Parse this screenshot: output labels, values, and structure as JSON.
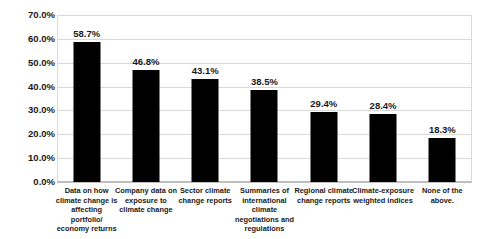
{
  "chart_data": {
    "type": "bar",
    "title": "",
    "subtitle": "",
    "xlabel": "",
    "ylabel": "",
    "ylim": [
      0,
      70
    ],
    "grid": true,
    "legend": false,
    "legend_position": "none",
    "bar_color": "#000000",
    "gridline_color": "#D9D9D9",
    "value_label_suffix": "%",
    "categories": [
      "Data on how climate change is affecting portfolio/ economy returns",
      "Company data on exposure to climate change",
      "Sector climate change reports",
      "Summaries of international climate negotiations and regulations",
      "Regional climate change reports",
      "Climate-exposure weighted indices",
      "None of the above."
    ],
    "values": [
      58.7,
      46.8,
      43.1,
      38.5,
      29.4,
      28.4,
      18.3
    ],
    "value_labels": [
      "58.7%",
      "46.8%",
      "43.1%",
      "38.5%",
      "29.4%",
      "28.4%",
      "18.3%"
    ],
    "yticks": [
      70,
      60,
      50,
      40,
      30,
      20,
      10,
      0
    ],
    "ytick_labels": [
      "70.0%",
      "60.0%",
      "50.0%",
      "40.0%",
      "30.0%",
      "20.0%",
      "10.0%",
      "0.0%"
    ]
  }
}
